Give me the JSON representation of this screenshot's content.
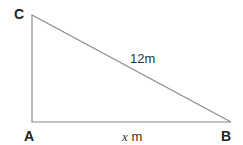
{
  "diagram": {
    "type": "right-triangle",
    "vertices": {
      "A": {
        "label": "A",
        "x": 32,
        "y": 122
      },
      "B": {
        "label": "B",
        "x": 231,
        "y": 122
      },
      "C": {
        "label": "C",
        "x": 32,
        "y": 15
      }
    },
    "sides": {
      "hypotenuse_CB": {
        "label": "12m"
      },
      "base_AB": {
        "variable": "x",
        "unit": " m"
      }
    },
    "line_color": "#888888"
  }
}
